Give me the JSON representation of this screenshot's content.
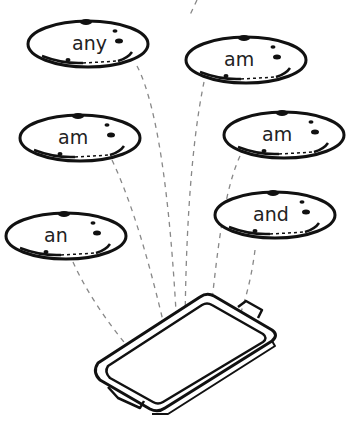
{
  "worksheet": {
    "cookies": [
      {
        "word": "any",
        "cx": 88,
        "cy": 44
      },
      {
        "word": "am",
        "cx": 246,
        "cy": 60
      },
      {
        "word": "am",
        "cx": 80,
        "cy": 138
      },
      {
        "word": "am",
        "cx": 284,
        "cy": 135
      },
      {
        "word": "an",
        "cx": 66,
        "cy": 236
      },
      {
        "word": "and",
        "cx": 275,
        "cy": 215
      }
    ],
    "tray": {
      "label": "baking-tray"
    },
    "colors": {
      "ink": "#111111",
      "dash": "#888888",
      "background": "#ffffff"
    }
  }
}
